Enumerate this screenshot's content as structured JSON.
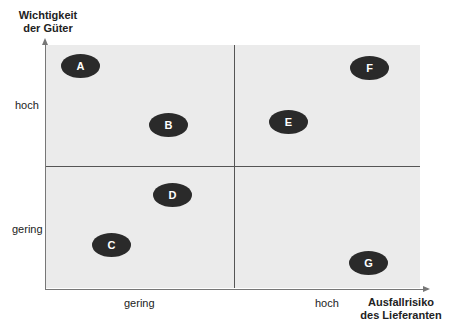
{
  "y_axis": {
    "title_line1": "Wichtigkeit",
    "title_line2": "der Güter",
    "tick_high": "hoch",
    "tick_low": "gering"
  },
  "x_axis": {
    "title_line1": "Ausfallrisiko",
    "title_line2": "des Lieferanten",
    "tick_low": "gering",
    "tick_high": "hoch"
  },
  "items": [
    {
      "label": "A",
      "x": 80,
      "y": 66
    },
    {
      "label": "B",
      "x": 168,
      "y": 125
    },
    {
      "label": "C",
      "x": 111,
      "y": 245
    },
    {
      "label": "D",
      "x": 173,
      "y": 195
    },
    {
      "label": "E",
      "x": 288,
      "y": 122
    },
    {
      "label": "F",
      "x": 369,
      "y": 68
    },
    {
      "label": "G",
      "x": 368,
      "y": 263
    }
  ],
  "colors": {
    "background": "#ebebeb",
    "ellipse": "#2a2a2a",
    "ellipse_text": "#ffffff"
  }
}
